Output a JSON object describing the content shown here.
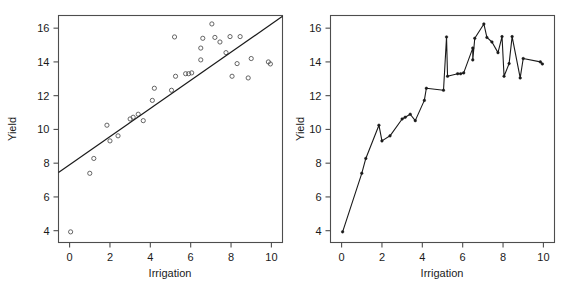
{
  "figure": {
    "background": "#ffffff",
    "panel_count": 2
  },
  "chart_data": [
    {
      "type": "scatter",
      "panel": "left",
      "title": "",
      "xlabel": "Irrigation",
      "ylabel": "Yield",
      "xlim": [
        -0.55,
        10.55
      ],
      "ylim": [
        3.3,
        16.75
      ],
      "xticks": [
        0,
        2,
        4,
        6,
        8,
        10
      ],
      "xticklabels": [
        "0",
        "2",
        "4",
        "6",
        "8",
        "10"
      ],
      "yticks": [
        4,
        6,
        8,
        10,
        12,
        14,
        16
      ],
      "yticklabels": [
        "4",
        "6",
        "8",
        "10",
        "12",
        "14",
        "16"
      ],
      "grid": false,
      "legend": null,
      "marker": "open-circle",
      "marker_color": "#555555",
      "x": [
        0.05,
        1.0,
        1.2,
        1.85,
        2.0,
        2.4,
        3.0,
        3.15,
        3.4,
        3.65,
        4.1,
        4.2,
        5.05,
        5.2,
        5.25,
        5.75,
        5.9,
        6.05,
        6.5,
        6.5,
        6.6,
        7.05,
        7.2,
        7.45,
        7.75,
        7.95,
        8.05,
        8.3,
        8.45,
        8.85,
        9.0,
        9.85,
        9.95
      ],
      "y": [
        3.93,
        7.4,
        8.28,
        10.25,
        9.32,
        9.62,
        10.62,
        10.72,
        10.9,
        10.52,
        11.72,
        12.44,
        12.32,
        15.48,
        13.15,
        13.3,
        13.3,
        13.35,
        14.82,
        14.12,
        15.4,
        16.25,
        15.45,
        15.18,
        14.55,
        15.5,
        13.15,
        13.9,
        15.5,
        13.05,
        14.2,
        14.0,
        13.88
      ],
      "fit_line": {
        "description": "straight regression line",
        "x": [
          -0.55,
          10.55
        ],
        "y": [
          7.45,
          16.7
        ],
        "color": "#1a1a1a"
      }
    },
    {
      "type": "line",
      "panel": "right",
      "title": "",
      "xlabel": "Irrigation",
      "ylabel": "Yield",
      "xlim": [
        -0.55,
        10.55
      ],
      "ylim": [
        3.3,
        16.75
      ],
      "xticks": [
        0,
        2,
        4,
        6,
        8,
        10
      ],
      "xticklabels": [
        "0",
        "2",
        "4",
        "6",
        "8",
        "10"
      ],
      "yticks": [
        4,
        6,
        8,
        10,
        12,
        14,
        16
      ],
      "yticklabels": [
        "4",
        "6",
        "8",
        "10",
        "12",
        "14",
        "16"
      ],
      "grid": false,
      "legend": null,
      "marker": "filled-point",
      "line_color": "#1a1a1a",
      "x": [
        0.05,
        1.0,
        1.2,
        1.85,
        2.0,
        2.4,
        3.0,
        3.15,
        3.4,
        3.65,
        4.1,
        4.2,
        5.05,
        5.2,
        5.25,
        5.75,
        5.9,
        6.05,
        6.5,
        6.5,
        6.6,
        7.05,
        7.2,
        7.45,
        7.75,
        7.95,
        8.05,
        8.3,
        8.45,
        8.85,
        9.0,
        9.85,
        9.95
      ],
      "y": [
        3.93,
        7.4,
        8.28,
        10.25,
        9.32,
        9.62,
        10.62,
        10.72,
        10.9,
        10.52,
        11.72,
        12.44,
        12.32,
        15.48,
        13.15,
        13.3,
        13.3,
        13.35,
        14.82,
        14.12,
        15.4,
        16.25,
        15.45,
        15.18,
        14.55,
        15.5,
        13.15,
        13.9,
        15.5,
        13.05,
        14.2,
        14.0,
        13.88
      ]
    }
  ]
}
